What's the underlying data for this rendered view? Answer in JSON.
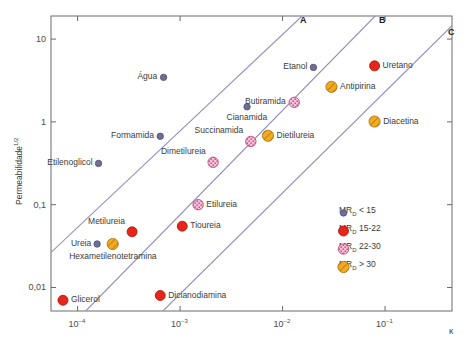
{
  "chart_data": {
    "type": "scatter",
    "title": "",
    "xlabel": "κ",
    "ylabel": "Permeabilidade",
    "ylabel_sup": "1/2",
    "xscale": "log",
    "yscale": "log",
    "xlim": [
      5.5e-05,
      0.45
    ],
    "ylim": [
      0.0052,
      19.0
    ],
    "grid": false,
    "xticks": [
      "10⁵4",
      "10⁵3",
      "10⁵2",
      "10⁵1"
    ],
    "xtick_values": [
      0.0001,
      0.001,
      0.01,
      0.1
    ],
    "yticks": [
      "10",
      "1",
      "0,1",
      "0,01"
    ],
    "ytick_values": [
      10,
      1,
      0.1,
      0.01
    ],
    "legend_position": "lower-right",
    "legend": [
      {
        "label": "MR",
        "sub": "D",
        "text": " < 15",
        "class": "small-purple",
        "color": "#6f6f96"
      },
      {
        "label": "MR",
        "sub": "D",
        "text": " 15-22",
        "class": "red",
        "color": "#e8251a"
      },
      {
        "label": "MR",
        "sub": "D",
        "text": " 22-30",
        "class": "pink",
        "color": "#f2a8c8"
      },
      {
        "label": "MR",
        "sub": "D",
        "text": " > 30",
        "class": "orange",
        "color": "#f0ab20"
      }
    ],
    "reference_lines": [
      {
        "name": "A",
        "x1": 5.5e-05,
        "y1": 0.0265,
        "x2": 0.0155,
        "y2": 19.0
      },
      {
        "name": "B",
        "x1": 0.00012,
        "y1": 0.0052,
        "x2": 0.08,
        "y2": 19.0
      },
      {
        "name": "C",
        "x1": 0.00068,
        "y1": 0.0052,
        "x2": 0.45,
        "y2": 14.5
      }
    ],
    "points": [
      {
        "name": "Água",
        "x": 0.00069,
        "y": 3.45,
        "group": "small-purple",
        "label_side": "left"
      },
      {
        "name": "Etanol",
        "x": 0.02,
        "y": 4.55,
        "group": "small-purple",
        "label_side": "left"
      },
      {
        "name": "Uretano",
        "x": 0.079,
        "y": 4.75,
        "group": "red",
        "label_side": "right"
      },
      {
        "name": "Antipirina",
        "x": 0.03,
        "y": 2.65,
        "group": "orange",
        "label_side": "right"
      },
      {
        "name": "Butiramida",
        "x": 0.013,
        "y": 1.72,
        "group": "pink",
        "label_side": "left"
      },
      {
        "name": "Cianamida",
        "x": 0.0045,
        "y": 1.52,
        "group": "small-purple",
        "label_side": "below"
      },
      {
        "name": "Diacetina",
        "x": 0.079,
        "y": 1.01,
        "group": "orange",
        "label_side": "right"
      },
      {
        "name": "Dietilureia",
        "x": 0.0072,
        "y": 0.68,
        "group": "orange",
        "label_side": "right"
      },
      {
        "name": "Succinamida",
        "x": 0.0049,
        "y": 0.58,
        "group": "pink",
        "label_side": "above-left"
      },
      {
        "name": "Formamida",
        "x": 0.00064,
        "y": 0.67,
        "group": "small-purple",
        "label_side": "left"
      },
      {
        "name": "Dimetilureia",
        "x": 0.0021,
        "y": 0.325,
        "group": "pink",
        "label_side": "above-left"
      },
      {
        "name": "Etilenoglicol",
        "x": 0.00016,
        "y": 0.315,
        "group": "small-purple",
        "label_side": "left"
      },
      {
        "name": "Etilureia",
        "x": 0.0015,
        "y": 0.1,
        "group": "pink",
        "label_side": "right"
      },
      {
        "name": "Tioureia",
        "x": 0.00105,
        "y": 0.055,
        "group": "red",
        "label_side": "right"
      },
      {
        "name": "Metilureia",
        "x": 0.00034,
        "y": 0.047,
        "group": "red",
        "label_side": "above-left"
      },
      {
        "name": "Ureia",
        "x": 0.000155,
        "y": 0.0335,
        "group": "small-purple",
        "label_side": "left"
      },
      {
        "name": "Hexametilenotetramina",
        "x": 0.00022,
        "y": 0.0335,
        "group": "orange",
        "label_side": "below"
      },
      {
        "name": "Glicerol",
        "x": 7.2e-05,
        "y": 0.007,
        "group": "red",
        "label_side": "right"
      },
      {
        "name": "Dicianodiamina",
        "x": 0.00064,
        "y": 0.008,
        "group": "red",
        "label_side": "right"
      }
    ]
  },
  "axes": {
    "x_axis_label": "κ",
    "y_axis_label": "Permeabilidade",
    "y_axis_exponent": "1/2",
    "x_tick_labels": [
      "10–4",
      "10–3",
      "10–2",
      "10–1"
    ],
    "y_tick_labels": [
      "10",
      "1",
      "0,1",
      "0,01"
    ]
  },
  "curve_labels": {
    "a": "A",
    "b": "B",
    "c": "C"
  },
  "legend": {
    "items": [
      {
        "prefix": "MR",
        "sub": "D",
        "suffix": " < 15"
      },
      {
        "prefix": "MR",
        "sub": "D",
        "suffix": " 15-22"
      },
      {
        "prefix": "MR",
        "sub": "D",
        "suffix": " 22-30"
      },
      {
        "prefix": "MR",
        "sub": "D",
        "suffix": " > 30"
      }
    ]
  },
  "colors": {
    "small_purple": "#6f6f96",
    "red": "#e8251a",
    "pink": "#f2a8c8",
    "orange": "#f0ab20",
    "line": "#8f8fc0",
    "axis": "#6a6a6a",
    "text": "#3b3b3b"
  }
}
